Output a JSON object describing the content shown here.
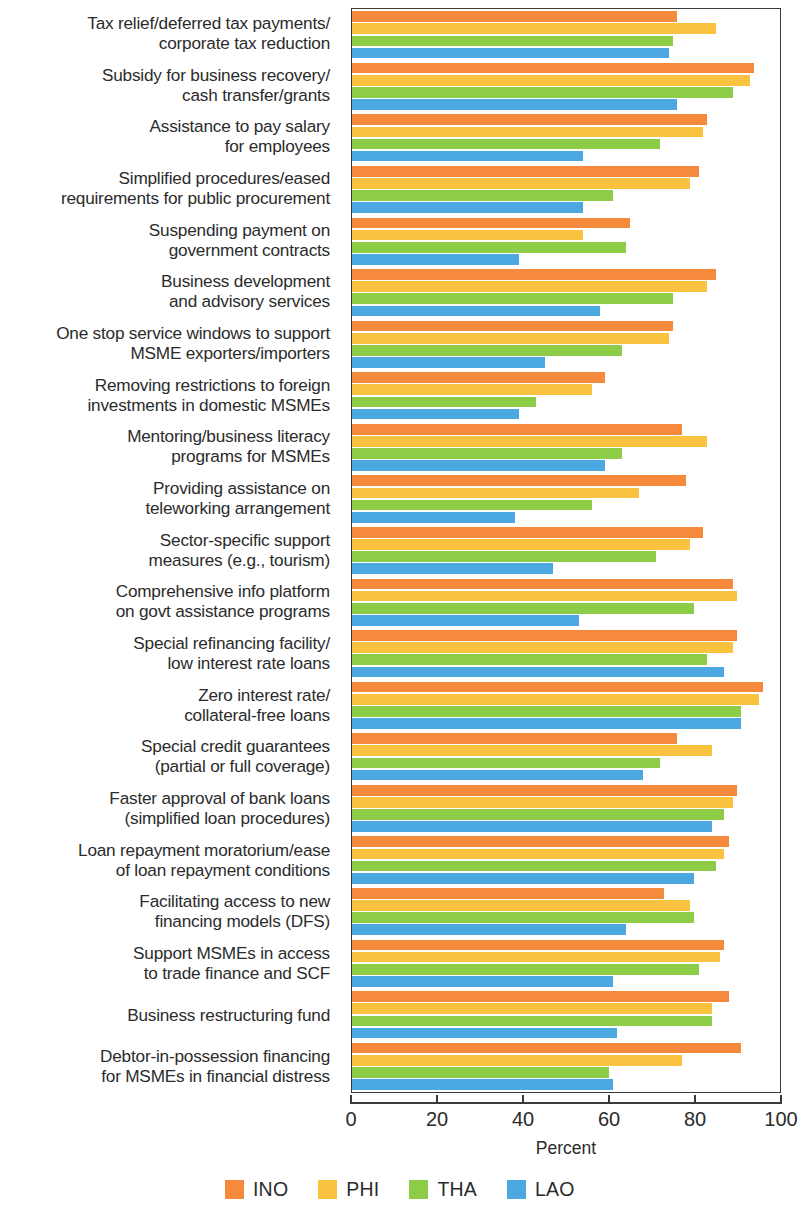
{
  "chart_data": {
    "type": "bar",
    "orientation": "horizontal",
    "title": "",
    "xlabel": "Percent",
    "ylabel": "",
    "xlim": [
      0,
      100
    ],
    "xticks": [
      0,
      20,
      40,
      60,
      80,
      100
    ],
    "grid": false,
    "legend_position": "bottom",
    "categories": [
      "Tax relief/deferred tax payments/\ncorporate tax reduction",
      "Subsidy for business recovery/\ncash transfer/grants",
      "Assistance to pay salary\nfor employees",
      "Simplified procedures/eased\nrequirements for public procurement",
      "Suspending payment on\ngovernment contracts",
      "Business development\nand advisory services",
      "One stop service windows to support\nMSME exporters/importers",
      "Removing restrictions to foreign\ninvestments in domestic MSMEs",
      "Mentoring/business literacy\nprograms for MSMEs",
      "Providing assistance on\nteleworking arrangement",
      "Sector-specific support\nmeasures (e.g., tourism)",
      "Comprehensive info platform\non govt assistance programs",
      "Special refinancing facility/\nlow interest rate loans",
      "Zero interest rate/\ncollateral-free loans",
      "Special credit guarantees\n(partial or full coverage)",
      "Faster approval of bank loans\n(simplified loan procedures)",
      "Loan repayment moratorium/ease\nof loan repayment conditions",
      "Facilitating access to new\nfinancing models (DFS)",
      "Support MSMEs in access\nto trade finance and SCF",
      "Business restructuring fund",
      "Debtor-in-possession financing\nfor MSMEs in financial distress"
    ],
    "series": [
      {
        "name": "INO",
        "color": "#F58A3C",
        "values": [
          76,
          94,
          83,
          81,
          65,
          85,
          75,
          59,
          77,
          78,
          82,
          89,
          90,
          96,
          76,
          90,
          88,
          73,
          87,
          88,
          91
        ]
      },
      {
        "name": "PHI",
        "color": "#F9C23F",
        "values": [
          85,
          93,
          82,
          79,
          54,
          83,
          74,
          56,
          83,
          67,
          79,
          90,
          89,
          95,
          84,
          89,
          87,
          79,
          86,
          84,
          77
        ]
      },
      {
        "name": "THA",
        "color": "#8DCC46",
        "values": [
          75,
          89,
          72,
          61,
          64,
          75,
          63,
          43,
          63,
          56,
          71,
          80,
          83,
          91,
          72,
          87,
          85,
          80,
          81,
          84,
          60
        ]
      },
      {
        "name": "LAO",
        "color": "#4BA8E0",
        "values": [
          74,
          76,
          54,
          54,
          39,
          58,
          45,
          39,
          59,
          38,
          47,
          53,
          87,
          91,
          68,
          84,
          80,
          64,
          61,
          62,
          61
        ]
      }
    ]
  },
  "axis": {
    "tick_labels": [
      "0",
      "20",
      "40",
      "60",
      "80",
      "100"
    ],
    "x_title": "Percent"
  },
  "legend": {
    "items": [
      {
        "label": "INO",
        "color": "#F58A3C"
      },
      {
        "label": "PHI",
        "color": "#F9C23F"
      },
      {
        "label": "THA",
        "color": "#8DCC46"
      },
      {
        "label": "LAO",
        "color": "#4BA8E0"
      }
    ]
  }
}
